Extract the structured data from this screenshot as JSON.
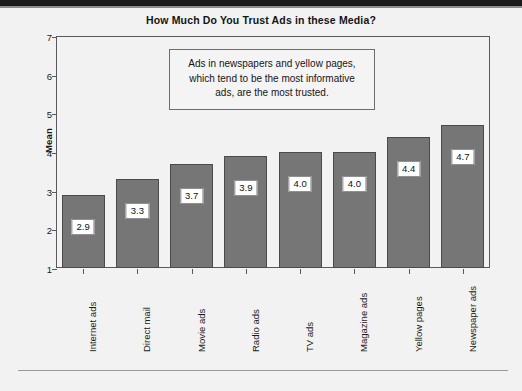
{
  "chart_data": {
    "type": "bar",
    "title": "How Much Do You Trust Ads in these Media?",
    "xlabel": "",
    "ylabel": "Mean",
    "categories": [
      "Internet ads",
      "Direct mail",
      "Movie ads",
      "Radio ads",
      "TV ads",
      "Magazine ads",
      "Yellow pages",
      "Newspaper ads"
    ],
    "values": [
      2.9,
      3.3,
      3.7,
      3.9,
      4.0,
      4.0,
      4.4,
      4.7
    ],
    "value_labels": [
      "2.9",
      "3.3",
      "3.7",
      "3.9",
      "4.0",
      "4.0",
      "4.4",
      "4.7"
    ],
    "ylim": [
      1,
      7
    ],
    "yticks": [
      1,
      2,
      3,
      4,
      5,
      6,
      7
    ],
    "ytick_labels": [
      "1",
      "2",
      "3",
      "4",
      "5",
      "6",
      "7"
    ],
    "grid": false,
    "legend": "none",
    "bar_color": "#767676",
    "bar_edge_color": "#4a4a4a",
    "plot_background": "#f2f2f2",
    "annotation": {
      "lines": [
        "Ads in newspapers and yellow pages,",
        "which tend to be the most informative",
        "ads, are the most trusted."
      ]
    }
  }
}
